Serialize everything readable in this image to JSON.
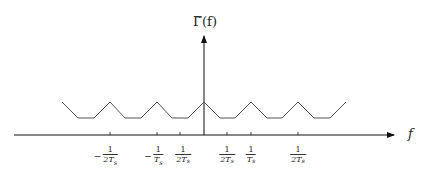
{
  "diagram": {
    "y_axis_label": "Γ̃(f)",
    "x_axis_label": "f",
    "colors": {
      "axis": "#111111",
      "waveform": "#555555",
      "text": "#222222"
    },
    "ticks": [
      {
        "sign": "−",
        "numerator": "1",
        "denominator": "2T",
        "sub": "s",
        "x": 110
      },
      {
        "sign": "−",
        "numerator": "1",
        "denominator": "T",
        "sub": "s",
        "x": 157
      },
      {
        "sign": "",
        "numerator": "1",
        "denominator": "2T",
        "sub": "s",
        "x": 180
      },
      {
        "sign": "",
        "numerator": "1",
        "denominator": "2T",
        "sub": "s",
        "x": 227
      },
      {
        "sign": "",
        "numerator": "1",
        "denominator": "T",
        "sub": "s",
        "x": 251
      },
      {
        "sign": "",
        "numerator": "1",
        "denominator": "2T",
        "sub": "s",
        "x": 298
      }
    ],
    "waveform": {
      "description": "Periodic trapezoidal ripple centered at f=0, peaks repeating every 1/Ts",
      "peak_x": [
        110,
        157,
        204,
        251,
        298
      ],
      "level_high": 102,
      "level_low": 118
    }
  }
}
